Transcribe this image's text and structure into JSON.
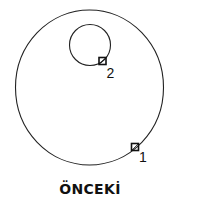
{
  "diagram": {
    "caption": "ÖNCEKİ",
    "stroke_color": "#222222",
    "big_circle": {
      "cx": 89.5,
      "cy": 87.5,
      "rx": 74,
      "ry": 77.5
    },
    "small_circle": {
      "cx": 90,
      "cy": 45,
      "r": 20.5
    },
    "points": [
      {
        "label": "1",
        "x": 135,
        "y": 147
      },
      {
        "label": "2",
        "x": 102.5,
        "y": 61
      }
    ]
  }
}
